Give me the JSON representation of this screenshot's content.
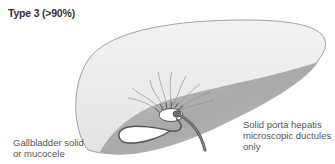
{
  "title": "Type 3 (>90%)",
  "labels": {
    "gallbladder_line1": "Gallbladder solid",
    "gallbladder_line2": "or mucocele",
    "porta_line1": "Solid porta hepatis",
    "porta_line2": "microscopic ductules",
    "porta_line3": "only"
  },
  "colors": {
    "liver_top": "#ececec",
    "liver_under": "#a8a8a8",
    "outline": "#8a8a8a",
    "duct": "#555555",
    "text": "#555555"
  }
}
